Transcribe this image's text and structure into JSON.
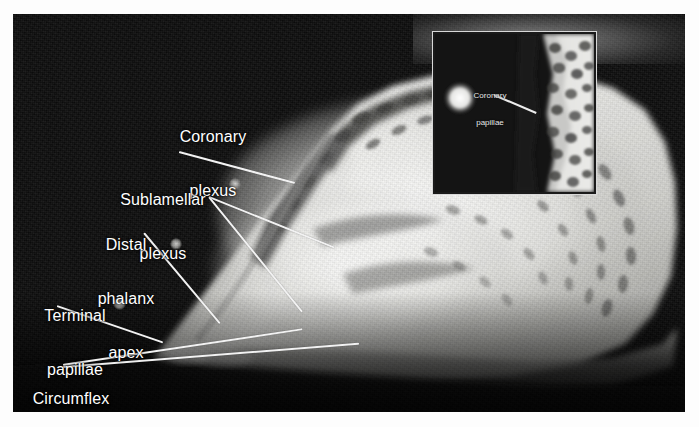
{
  "figure": {
    "kind": "radiograph",
    "background_color": "#fdfdfd",
    "plate_color": "#0d0d0d",
    "label_color": "#ffffff",
    "leader_color": "#f2f2f2"
  },
  "main_labels": [
    {
      "id": "coronary-plexus",
      "text": "Coronary\nplexus",
      "lines": [
        "Coronary",
        "plexus"
      ]
    },
    {
      "id": "sublamellar-plexus",
      "text": "Sublamellar\nplexus",
      "lines": [
        "Sublamellar",
        "plexus"
      ]
    },
    {
      "id": "distal-phalanx-apex",
      "text": "Distal\nphalanx\napex",
      "lines": [
        "Distal",
        "phalanx",
        "apex"
      ]
    },
    {
      "id": "terminal-papillae",
      "text": "Terminal\npapillae",
      "lines": [
        "Terminal",
        "papillae"
      ]
    },
    {
      "id": "circumflex-vein",
      "text": "Circumflex\nvein",
      "lines": [
        "Circumflex",
        "vein"
      ]
    }
  ],
  "label_text": {
    "coronary_l1": "Coronary",
    "coronary_l2": "plexus",
    "sublamellar_l1": "Sublamellar",
    "sublamellar_l2": "plexus",
    "distal_l1": "Distal",
    "distal_l2": "phalanx",
    "distal_l3": "apex",
    "terminal_l1": "Terminal",
    "terminal_l2": "papillae",
    "circumflex_l1": "Circumflex",
    "circumflex_l2": "vein"
  },
  "inset": {
    "label_l1": "Coronary",
    "label_l2": "papillae",
    "border_color": "#1a1a1a",
    "frame_color": "#d8d8d8"
  }
}
